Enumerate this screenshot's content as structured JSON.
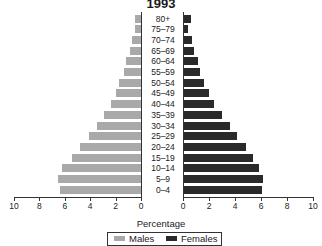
{
  "chart_data": {
    "type": "bar",
    "orientation": "horizontal",
    "subtype": "population-pyramid",
    "title": "1993",
    "xlabel": "Percentage",
    "ylabel": "",
    "categories": [
      "80+",
      "75–79",
      "70–74",
      "65–69",
      "60–64",
      "55–59",
      "50–54",
      "45–49",
      "40–44",
      "35–39",
      "30–34",
      "25–29",
      "20–24",
      "15–19",
      "10–14",
      "5–9",
      "0–4"
    ],
    "series": [
      {
        "name": "Males",
        "color": "#a9a9a9",
        "side": "left",
        "values": [
          0.5,
          0.5,
          0.7,
          0.9,
          1.2,
          1.3,
          1.7,
          2.0,
          2.4,
          2.9,
          3.5,
          4.1,
          4.8,
          5.4,
          6.2,
          6.5,
          6.4
        ]
      },
      {
        "name": "Females",
        "color": "#2a2a2a",
        "side": "right",
        "values": [
          0.5,
          0.3,
          0.6,
          0.8,
          1.1,
          1.2,
          1.5,
          1.9,
          2.3,
          2.9,
          3.5,
          4.1,
          4.8,
          5.3,
          5.8,
          6.1,
          6.0
        ]
      }
    ],
    "xlim": [
      0,
      10
    ],
    "left_ticks": [
      "10",
      "8",
      "6",
      "4",
      "2",
      "0"
    ],
    "right_ticks": [
      "0",
      "2",
      "4",
      "6",
      "8",
      "10"
    ],
    "grid": false,
    "legend_position": "bottom"
  },
  "legend": {
    "males": "Males",
    "females": "Females"
  }
}
